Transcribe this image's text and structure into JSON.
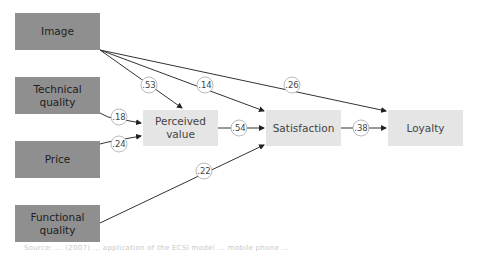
{
  "diagram": {
    "type": "path-model",
    "nodes": [
      {
        "id": "image",
        "label": "Image",
        "style": "dark"
      },
      {
        "id": "technical_quality",
        "label": "Technical quality",
        "style": "dark"
      },
      {
        "id": "price",
        "label": "Price",
        "style": "dark"
      },
      {
        "id": "functional_quality",
        "label": "Functional quality",
        "style": "dark"
      },
      {
        "id": "perceived_value",
        "label": "Perceived value",
        "style": "light"
      },
      {
        "id": "satisfaction",
        "label": "Satisfaction",
        "style": "light"
      },
      {
        "id": "loyalty",
        "label": "Loyalty",
        "style": "light"
      }
    ],
    "edges": [
      {
        "from": "image",
        "to": "perceived_value",
        "coefficient": ".53"
      },
      {
        "from": "image",
        "to": "satisfaction",
        "coefficient": ".14"
      },
      {
        "from": "image",
        "to": "loyalty",
        "coefficient": ".26"
      },
      {
        "from": "technical_quality",
        "to": "perceived_value",
        "coefficient": ".18"
      },
      {
        "from": "price",
        "to": "perceived_value",
        "coefficient": ".24"
      },
      {
        "from": "functional_quality",
        "to": "satisfaction",
        "coefficient": ".22"
      },
      {
        "from": "perceived_value",
        "to": "satisfaction",
        "coefficient": ".54"
      },
      {
        "from": "satisfaction",
        "to": "loyalty",
        "coefficient": ".38"
      }
    ],
    "labels": {
      "image": "Image",
      "technical_quality_1": "Technical",
      "technical_quality_2": "quality",
      "price": "Price",
      "functional_quality_1": "Functional",
      "functional_quality_2": "quality",
      "perceived_value_1": "Perceived",
      "perceived_value_2": "value",
      "satisfaction": "Satisfaction",
      "loyalty": "Loyalty"
    },
    "coefficients": {
      "image_pv": ".53",
      "image_sat": ".14",
      "image_loy": ".26",
      "tech_pv": ".18",
      "price_pv": ".24",
      "func_sat": ".22",
      "pv_sat": ".54",
      "sat_loy": ".38"
    }
  },
  "caption": "Source: ... (2007) ... application of the ECSI model ... mobile phone ..."
}
